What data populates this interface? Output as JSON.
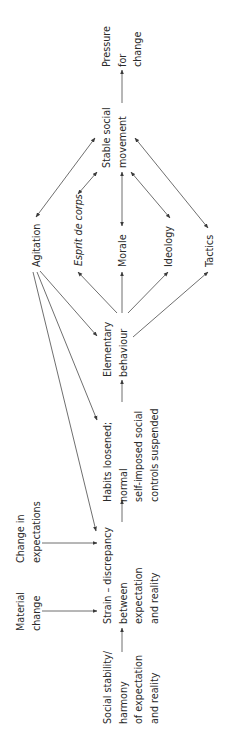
{
  "figure": {
    "orientation": "rotated-90-ccw",
    "text_color": "#2a2a2a",
    "line_color": "#4a4a4a",
    "background": "#ffffff"
  },
  "nodes": {
    "social_stability": {
      "lines": [
        "Social stability/",
        "harmony",
        "of expectation",
        "and reality"
      ]
    },
    "material_change": {
      "lines": [
        "Material",
        "change"
      ]
    },
    "change_in_expectations": {
      "lines": [
        "Change in",
        "expectations"
      ]
    },
    "strain": {
      "lines": [
        "Strain – discrepancy",
        "between",
        "expectation",
        "and reality"
      ]
    },
    "habits_loosened": {
      "lines": [
        "Habits loosened;",
        "normal",
        "self-imposed social",
        "controls suspended"
      ]
    },
    "elementary_behaviour": {
      "lines": [
        "Elementary",
        "behaviour"
      ]
    },
    "agitation": {
      "lines": [
        "Agitation"
      ]
    },
    "esprit_de_corps": {
      "lines": [
        "Esprit de corps"
      ]
    },
    "morale": {
      "lines": [
        "Morale"
      ]
    },
    "ideology": {
      "lines": [
        "Ideology"
      ]
    },
    "tactics": {
      "lines": [
        "Tactics"
      ]
    },
    "stable_social_movement": {
      "lines": [
        "Stable social",
        "movement"
      ]
    },
    "pressure_for_change": {
      "lines": [
        "Pressure",
        "for",
        "change"
      ]
    }
  },
  "edges": [
    {
      "from": "social_stability",
      "to": "strain",
      "type": "one-way"
    },
    {
      "from": "material_change",
      "to": "strain",
      "type": "one-way"
    },
    {
      "from": "change_in_expectations",
      "to": "strain",
      "type": "one-way"
    },
    {
      "from": "strain",
      "to": "habits_loosened",
      "type": "one-way"
    },
    {
      "from": "habits_loosened",
      "to": "elementary_behaviour",
      "type": "one-way"
    },
    {
      "from": "agitation",
      "to": "strain",
      "type": "one-way"
    },
    {
      "from": "agitation",
      "to": "habits_loosened",
      "type": "one-way"
    },
    {
      "from": "agitation",
      "to": "elementary_behaviour",
      "type": "one-way"
    },
    {
      "from": "elementary_behaviour",
      "to": "esprit_de_corps",
      "type": "one-way"
    },
    {
      "from": "elementary_behaviour",
      "to": "morale",
      "type": "one-way"
    },
    {
      "from": "elementary_behaviour",
      "to": "ideology",
      "type": "one-way"
    },
    {
      "from": "elementary_behaviour",
      "to": "tactics",
      "type": "one-way"
    },
    {
      "from": "agitation",
      "to": "stable_social_movement",
      "type": "two-way"
    },
    {
      "from": "esprit_de_corps",
      "to": "stable_social_movement",
      "type": "two-way"
    },
    {
      "from": "morale",
      "to": "stable_social_movement",
      "type": "two-way"
    },
    {
      "from": "ideology",
      "to": "stable_social_movement",
      "type": "two-way"
    },
    {
      "from": "tactics",
      "to": "stable_social_movement",
      "type": "two-way"
    },
    {
      "from": "stable_social_movement",
      "to": "pressure_for_change",
      "type": "one-way"
    }
  ]
}
